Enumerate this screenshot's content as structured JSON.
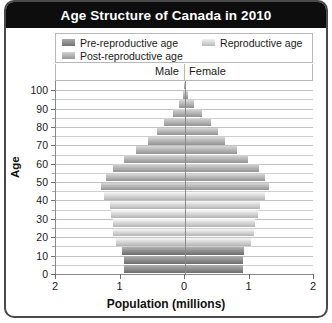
{
  "chart": {
    "title": "Age Structure of Canada in 2010",
    "legend": [
      {
        "label": "Pre-reproductive age",
        "color": "#8f8f8f",
        "key": "pre"
      },
      {
        "label": "Reproductive age",
        "color": "#d6d6d6",
        "key": "repro"
      },
      {
        "label": "Post-reproductive age",
        "color": "#b5b5b5",
        "key": "post"
      }
    ],
    "male_label": "Male",
    "female_label": "Female",
    "ylabel": "Age",
    "xlabel": "Population (millions)",
    "xticks": [
      "2",
      "1",
      "0",
      "1",
      "2"
    ],
    "yticks": [
      "0",
      "10",
      "20",
      "30",
      "40",
      "50",
      "60",
      "70",
      "80",
      "90",
      "100"
    ]
  },
  "chart_data": {
    "type": "bar",
    "subtype": "population-pyramid",
    "title": "Age Structure of Canada in 2010",
    "xlabel": "Population (millions)",
    "ylabel": "Age",
    "xlim": [
      -2,
      2
    ],
    "ylim": [
      0,
      105
    ],
    "xtick_values": [
      -2,
      -1,
      0,
      1,
      2
    ],
    "xtick_labels": [
      "2",
      "1",
      "0",
      "1",
      "2"
    ],
    "ytick_values": [
      0,
      10,
      20,
      30,
      40,
      50,
      60,
      70,
      80,
      90,
      100
    ],
    "ytick_labels": [
      "0",
      "10",
      "20",
      "30",
      "40",
      "50",
      "60",
      "70",
      "80",
      "90",
      "100"
    ],
    "minor_ytick_interval": 5,
    "grid": true,
    "legend_position": "top",
    "bar_unit": "millions of people",
    "age_group_width": 5,
    "categories": [
      "0-4",
      "5-9",
      "10-14",
      "15-19",
      "20-24",
      "25-29",
      "30-34",
      "35-39",
      "40-44",
      "45-49",
      "50-54",
      "55-59",
      "60-64",
      "65-69",
      "70-74",
      "75-79",
      "80-84",
      "85-89",
      "90-94",
      "95-99",
      "100+"
    ],
    "series": [
      {
        "name": "Male",
        "side": "left",
        "values": [
          0.95,
          0.95,
          0.97,
          1.07,
          1.12,
          1.12,
          1.15,
          1.17,
          1.25,
          1.3,
          1.23,
          1.12,
          0.95,
          0.76,
          0.57,
          0.44,
          0.32,
          0.19,
          0.09,
          0.03,
          0.01
        ]
      },
      {
        "name": "Female",
        "side": "right",
        "values": [
          0.9,
          0.9,
          0.92,
          1.02,
          1.07,
          1.09,
          1.13,
          1.16,
          1.24,
          1.3,
          1.24,
          1.14,
          0.98,
          0.8,
          0.62,
          0.51,
          0.41,
          0.27,
          0.14,
          0.05,
          0.01
        ]
      }
    ],
    "color_groups": [
      {
        "name": "Pre-reproductive age",
        "ages": "0-14",
        "color": "#8f8f8f"
      },
      {
        "name": "Reproductive age",
        "ages": "15-44",
        "color": "#d6d6d6"
      },
      {
        "name": "Post-reproductive age",
        "ages": "45+",
        "color": "#b5b5b5"
      }
    ]
  }
}
